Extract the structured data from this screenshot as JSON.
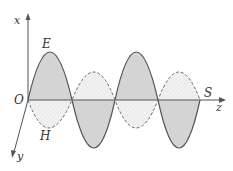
{
  "diagram": {
    "labels": {
      "x_axis": "x",
      "y_axis": "y",
      "z_axis": "z",
      "origin": "O",
      "e_field": "E",
      "h_field": "H",
      "poynting": "S"
    },
    "colors": {
      "stroke": "#555555",
      "fill": "#d8d8d8",
      "hatch": "#bbbbbb"
    },
    "e_wave": {
      "style": "solid",
      "half_cycles": 4,
      "amplitude_px": 52
    },
    "h_wave": {
      "style": "dashed",
      "half_cycles": 4,
      "amplitude_px": 28
    }
  }
}
